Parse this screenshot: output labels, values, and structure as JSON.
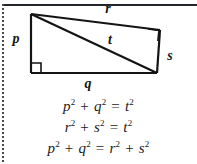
{
  "figure": {
    "type": "geometry-diagram",
    "shape": "right-trapezoid-with-diagonal",
    "vertices": {
      "top_left": [
        31,
        14
      ],
      "top_right": [
        160,
        30
      ],
      "bottom_right": [
        157,
        73
      ],
      "bottom_left": [
        31,
        73
      ]
    },
    "diagonal": {
      "from": "top_left",
      "to": "bottom_right",
      "label": "t"
    },
    "right_angle_marks": [
      "bottom_left",
      "top_right"
    ],
    "labels": {
      "left_side": "p",
      "bottom_side": "q",
      "top_side": "r",
      "right_side": "s",
      "diagonal": "t"
    }
  },
  "equations": [
    {
      "id": "eq1",
      "text": "p² + q² = t²",
      "terms": [
        {
          "base": "p",
          "exp": "2"
        },
        {
          "op": "+"
        },
        {
          "base": "q",
          "exp": "2"
        },
        {
          "op": "="
        },
        {
          "base": "t",
          "exp": "2"
        }
      ]
    },
    {
      "id": "eq2",
      "text": "r² + s² = t²",
      "terms": [
        {
          "base": "r",
          "exp": "2"
        },
        {
          "op": "+"
        },
        {
          "base": "s",
          "exp": "2"
        },
        {
          "op": "="
        },
        {
          "base": "t",
          "exp": "2"
        }
      ]
    },
    {
      "id": "eq3",
      "text": "p² + q² = r² + s²",
      "terms": [
        {
          "base": "p",
          "exp": "2"
        },
        {
          "op": "+"
        },
        {
          "base": "q",
          "exp": "2"
        },
        {
          "op": "="
        },
        {
          "base": "r",
          "exp": "2"
        },
        {
          "op": "+"
        },
        {
          "base": "s",
          "exp": "2"
        }
      ]
    }
  ],
  "eq_parts": {
    "p": "p",
    "q": "q",
    "r": "r",
    "s": "s",
    "t": "t",
    "two": "2",
    "plus": "+",
    "equals": "="
  },
  "colors": {
    "ink": "#141414",
    "rule": "#23272b",
    "paper": "#ffffff",
    "margin_dots": "#4a4a4a"
  }
}
